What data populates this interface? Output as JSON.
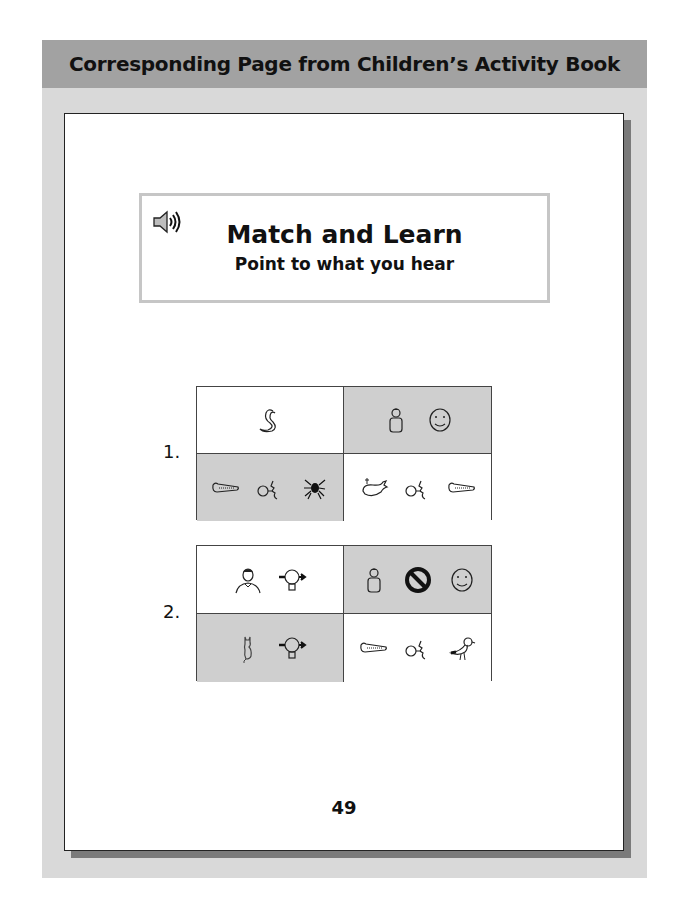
{
  "panel": {
    "header_title": "Corresponding Page from Children’s Activity Book"
  },
  "activity": {
    "icon": "speaker-icon",
    "title": "Match and Learn",
    "subtitle": "Point to what you hear"
  },
  "items": [
    {
      "number": "1.",
      "cells": [
        {
          "position": "top-left",
          "shaded": false,
          "symbols": [
            "snake"
          ]
        },
        {
          "position": "top-right",
          "shaded": true,
          "symbols": [
            "boy",
            "smiling-face"
          ]
        },
        {
          "position": "bottom-left",
          "shaded": true,
          "symbols": [
            "crocodile",
            "mouth-sound",
            "spider"
          ]
        },
        {
          "position": "bottom-right",
          "shaded": false,
          "symbols": [
            "whale",
            "mouth-sound",
            "crocodile"
          ]
        }
      ]
    },
    {
      "number": "2.",
      "cells": [
        {
          "position": "top-left",
          "shaded": false,
          "symbols": [
            "man",
            "lightbulb-idea"
          ]
        },
        {
          "position": "top-right",
          "shaded": true,
          "symbols": [
            "boy",
            "no-sign",
            "smiling-face"
          ]
        },
        {
          "position": "bottom-left",
          "shaded": true,
          "symbols": [
            "cat",
            "lightbulb-idea"
          ]
        },
        {
          "position": "bottom-right",
          "shaded": false,
          "symbols": [
            "crocodile",
            "mouth-sound",
            "bird"
          ]
        }
      ]
    }
  ],
  "page_number": "49",
  "colors": {
    "header_band": "#a2a2a2",
    "panel_bg": "#d9d9d9",
    "shaded_cell": "#cfcfcf",
    "title_box_border": "#c6c6c6"
  }
}
